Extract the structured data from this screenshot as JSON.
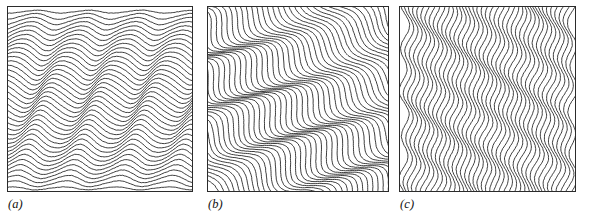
{
  "figure": {
    "background_color": "#ffffff",
    "line_color": "#1a1a1a",
    "frame_color": "#2b2b2b",
    "panel_count": 3
  },
  "panels": [
    {
      "id": "a",
      "label": "(a)",
      "orientation": "horizontal",
      "orientation_degrees": 0,
      "line_count": 39,
      "frame": {
        "x": 7,
        "y": 6,
        "width": 186,
        "height": 186
      },
      "label_position": {
        "x": 7,
        "y": 196
      },
      "wave": {
        "wavelength_px": 52,
        "amplitude_px": 8,
        "phase_shift_per_line_deg": 14,
        "amplitude_envelope": "tapered at top and bottom edges"
      }
    },
    {
      "id": "b",
      "label": "(b)",
      "orientation": "diagonal",
      "orientation_degrees": 45,
      "line_count": 52,
      "frame": {
        "x": 207,
        "y": 6,
        "width": 182,
        "height": 186
      },
      "label_position": {
        "x": 207,
        "y": 196
      },
      "wave": {
        "wavelength_px": 60,
        "amplitude_px": 9,
        "phase_shift_per_line_deg": 12,
        "amplitude_envelope": "uniform with local swirl bands"
      }
    },
    {
      "id": "c",
      "label": "(c)",
      "orientation": "vertical",
      "orientation_degrees": 90,
      "line_count": 41,
      "frame": {
        "x": 399,
        "y": 6,
        "width": 177,
        "height": 186
      },
      "label_position": {
        "x": 399,
        "y": 196
      },
      "wave": {
        "wavelength_px": 44,
        "amplitude_px": 4,
        "phase_shift_per_line_deg": 22,
        "amplitude_envelope": "uniform"
      }
    }
  ]
}
